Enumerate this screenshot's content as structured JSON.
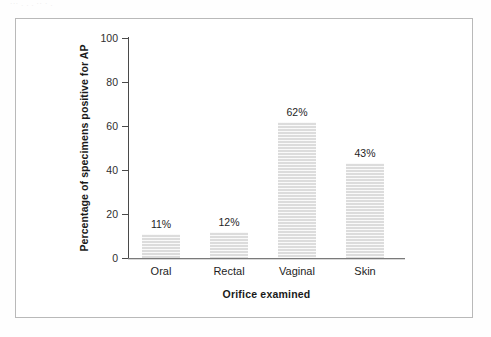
{
  "page": {
    "scan_artifact_text": "··· . . . ··  ·  ."
  },
  "chart_data": {
    "type": "bar",
    "title": "",
    "subtitle": "",
    "xlabel": "Orifice examined",
    "ylabel": "Percentage of specimens positive for AP",
    "categories": [
      "Oral",
      "Rectal",
      "Vaginal",
      "Skin"
    ],
    "values": [
      11,
      12,
      62,
      43
    ],
    "value_labels": [
      "11%",
      "12%",
      "62%",
      "43%"
    ],
    "ylim": [
      0,
      100
    ],
    "yticks": [
      0,
      20,
      40,
      60,
      80,
      100
    ],
    "ytick_labels": [
      "0",
      "20",
      "40",
      "60",
      "80",
      "100"
    ],
    "grid": false,
    "legend": false,
    "legend_position": "none",
    "bar_color": "#dcdcdc",
    "axis_color": "#4a4a4a",
    "text_color": "#1e1e1e"
  }
}
